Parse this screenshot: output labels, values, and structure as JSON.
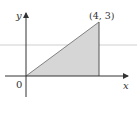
{
  "diagram": {
    "type": "coordinate-plane-region",
    "axes": {
      "x_label": "x",
      "y_label": "y",
      "origin_label": "0"
    },
    "vertices": [
      {
        "x": 0,
        "y": 0
      },
      {
        "x": 4,
        "y": 0
      },
      {
        "x": 4,
        "y": 3
      }
    ],
    "point_label": "(4, 3)",
    "colors": {
      "shading": "#d6d6d6",
      "lines": "#555555",
      "guide_line": "#c8c8c8"
    }
  }
}
